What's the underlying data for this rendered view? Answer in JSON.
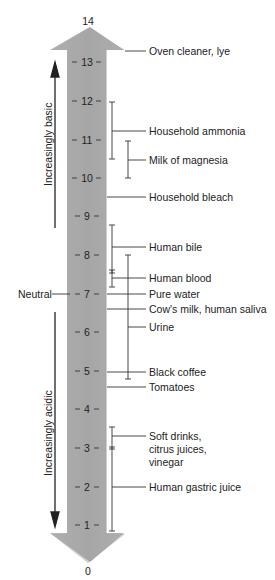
{
  "diagram": {
    "scale_top": "14",
    "scale_bottom": "0",
    "ticks": [
      "13",
      "12",
      "11",
      "10",
      "9",
      "8",
      "7",
      "6",
      "5",
      "4",
      "3",
      "2",
      "1"
    ],
    "direction_labels": {
      "up": "Increasingly basic",
      "down": "Increasingly acidic",
      "neutral": "Neutral"
    },
    "items": [
      {
        "label": "Oven cleaner, lye",
        "ph": 13.5
      },
      {
        "label": "Household ammonia",
        "ph_range": [
          10.5,
          12
        ]
      },
      {
        "label": "Milk of magnesia",
        "ph_range": [
          10,
          11
        ]
      },
      {
        "label": "Household bleach",
        "ph": 9.5
      },
      {
        "label": "Human bile",
        "ph_range": [
          7.5,
          8.8
        ]
      },
      {
        "label": "Human blood",
        "ph_range": [
          7.2,
          7.6
        ]
      },
      {
        "label": "Pure water",
        "ph": 7
      },
      {
        "label": "Cow's milk, human saliva",
        "ph": 6.6
      },
      {
        "label": "Urine",
        "ph_range": [
          4.8,
          8
        ]
      },
      {
        "label": "Black coffee",
        "ph": 5
      },
      {
        "label": "Tomatoes",
        "ph": 4.6
      },
      {
        "label_lines": [
          "Soft drinks,",
          "citrus juices,",
          "vinegar"
        ],
        "ph_range": [
          2.9,
          3.5
        ]
      },
      {
        "label": "Human gastric juice",
        "ph_range": [
          1,
          3
        ]
      }
    ],
    "colors": {
      "arrow_fill": "#a9a9a9",
      "line": "#222222",
      "background": "#ffffff"
    }
  }
}
